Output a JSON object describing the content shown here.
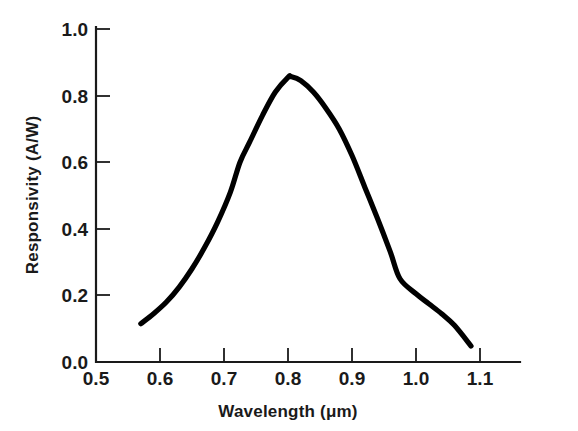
{
  "chart_data": {
    "type": "line",
    "title": "",
    "subtitle": "",
    "xlabel": "Wavelength (μm)",
    "ylabel": "Responsivity (A/W)",
    "xlim": [
      0.5,
      1.1
    ],
    "ylim": [
      0.0,
      1.0
    ],
    "xticks": [
      "0.5",
      "0.6",
      "0.7",
      "0.8",
      "0.9",
      "1.0",
      "1.1"
    ],
    "xtick_values": [
      0.5,
      0.6,
      0.7,
      0.8,
      0.9,
      1.0,
      1.1
    ],
    "yticks": [
      "0.0",
      "0.2",
      "0.4",
      "0.6",
      "0.8",
      "1.0"
    ],
    "ytick_values": [
      0.0,
      0.2,
      0.4,
      0.6,
      0.8,
      1.0
    ],
    "grid": false,
    "legend": null,
    "axis_style": "left-and-bottom-spines-with-inward-ticks",
    "line_color": "#000000",
    "series": [
      {
        "name": "Responsivity",
        "x": [
          0.57,
          0.59,
          0.61,
          0.63,
          0.65,
          0.67,
          0.69,
          0.71,
          0.725,
          0.74,
          0.76,
          0.78,
          0.8,
          0.805,
          0.82,
          0.84,
          0.86,
          0.88,
          0.9,
          0.92,
          0.94,
          0.96,
          0.975,
          1.0,
          1.02,
          1.04,
          1.06,
          1.086
        ],
        "y": [
          0.115,
          0.145,
          0.18,
          0.225,
          0.28,
          0.345,
          0.42,
          0.51,
          0.6,
          0.66,
          0.74,
          0.81,
          0.855,
          0.857,
          0.845,
          0.81,
          0.76,
          0.7,
          0.62,
          0.525,
          0.43,
          0.33,
          0.25,
          0.205,
          0.175,
          0.145,
          0.11,
          0.048
        ]
      }
    ],
    "annotations": {
      "peak_wavelength_um": 0.805,
      "peak_responsivity_aw": 0.86,
      "curve_start_um": 0.57,
      "curve_end_um": 1.086
    }
  },
  "axes": {
    "x_title": "Wavelength (μm)",
    "y_title": "Responsivity (A/W)"
  }
}
